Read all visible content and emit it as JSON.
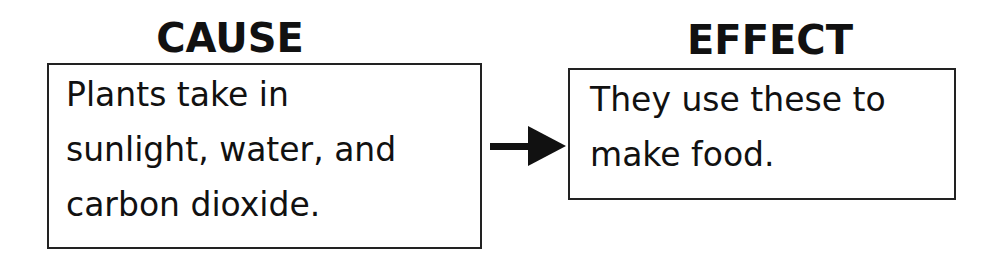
{
  "cause": {
    "heading": "CAUSE",
    "lines": [
      "Plants take in",
      "sunlight, water, and",
      "carbon dioxide."
    ]
  },
  "effect": {
    "heading": "EFFECT",
    "lines": [
      "They use these to",
      "make food."
    ]
  },
  "connector": {
    "icon": "arrow-right-icon",
    "direction": "cause-to-effect"
  }
}
